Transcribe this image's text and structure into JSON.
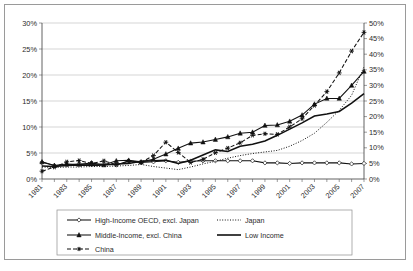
{
  "chart_data": {
    "type": "line",
    "title": "",
    "subtitle": "",
    "xlabel": "",
    "ylabel": "",
    "grid": true,
    "legend_position": "bottom",
    "x": [
      1981,
      1982,
      1983,
      1984,
      1985,
      1986,
      1987,
      1988,
      1989,
      1990,
      1991,
      1992,
      1993,
      1994,
      1995,
      1996,
      1997,
      1998,
      1999,
      2000,
      2001,
      2002,
      2003,
      2004,
      2005,
      2006,
      2007
    ],
    "xtick_labels": [
      "1981",
      "1983",
      "1985",
      "1987",
      "1989",
      "1991",
      "1993",
      "1995",
      "1997",
      "1999",
      "2001",
      "2003",
      "2005",
      "2007"
    ],
    "xlim": [
      1981,
      2007
    ],
    "left_axis": {
      "ylim": [
        0,
        30
      ],
      "ticks": [
        0,
        5,
        10,
        15,
        20,
        25,
        30
      ],
      "tick_labels": [
        "0%",
        "5%",
        "10%",
        "15%",
        "20%",
        "25%",
        "30%"
      ]
    },
    "right_axis": {
      "ylim": [
        0,
        50
      ],
      "ticks": [
        0,
        5,
        10,
        15,
        20,
        25,
        30,
        35,
        40,
        45,
        50
      ],
      "tick_labels": [
        "0%",
        "5%",
        "10%",
        "15%",
        "20%",
        "25%",
        "30%",
        "35%",
        "40%",
        "45%",
        "50%"
      ]
    },
    "series": [
      {
        "name": "High-Income OECD, excl. Japan",
        "axis": "left",
        "style": "solid-with-open-diamond",
        "dash": "none",
        "marker": "open-diamond",
        "values": [
          3.2,
          2.6,
          2.7,
          2.9,
          2.8,
          2.9,
          2.7,
          3.5,
          3.2,
          3.3,
          3.5,
          3.2,
          3.4,
          3.5,
          3.5,
          3.5,
          3.5,
          3.5,
          3.1,
          3.1,
          3.0,
          3.1,
          3.1,
          3.1,
          3.1,
          2.9,
          3.0
        ]
      },
      {
        "name": "Japan",
        "axis": "left",
        "style": "dotted",
        "dash": "1,1.6",
        "marker": "none",
        "values": [
          2.3,
          2.2,
          2.3,
          2.3,
          2.4,
          2.4,
          2.5,
          2.6,
          2.8,
          2.4,
          2.1,
          1.8,
          2.3,
          2.9,
          3.4,
          4.0,
          4.5,
          4.9,
          5.2,
          5.5,
          6.3,
          7.4,
          8.8,
          10.9,
          13.2,
          16.1,
          21.6
        ]
      },
      {
        "name": "Middle-Income, excl. China",
        "axis": "left",
        "style": "solid-with-filled-triangle",
        "dash": "none",
        "marker": "filled-triangle",
        "values": [
          3.3,
          2.6,
          2.9,
          2.8,
          3.1,
          2.7,
          3.5,
          3.6,
          3.3,
          3.8,
          4.8,
          5.9,
          6.9,
          7.1,
          7.6,
          8.1,
          8.8,
          9.0,
          10.3,
          10.4,
          11.1,
          12.3,
          14.4,
          15.5,
          15.5,
          18.0,
          20.7
        ]
      },
      {
        "name": "Low Income",
        "axis": "left",
        "style": "solid-thick",
        "dash": "none",
        "marker": "none",
        "values": [
          2.5,
          2.4,
          2.6,
          2.7,
          2.6,
          2.7,
          2.9,
          3.0,
          3.4,
          3.5,
          3.6,
          3.0,
          3.6,
          4.6,
          5.6,
          5.3,
          6.3,
          6.7,
          7.3,
          8.4,
          9.6,
          10.8,
          12.1,
          12.5,
          13.0,
          14.6,
          16.4
        ]
      },
      {
        "name": "China",
        "axis": "right",
        "style": "dashed-with-star",
        "dash": "4,2",
        "marker": "star",
        "values": [
          2.5,
          3.8,
          5.5,
          5.9,
          5.0,
          5.8,
          4.6,
          5.6,
          5.3,
          7.5,
          11.8,
          8.5,
          5.3,
          6.3,
          8.4,
          9.9,
          11.6,
          14.0,
          14.5,
          14.3,
          16.7,
          19.3,
          23.6,
          28.0,
          34.0,
          41.0,
          47.0
        ]
      }
    ]
  },
  "legend": {
    "items": [
      {
        "label": "High-Income OECD, excl. Japan",
        "marker": "open-diamond"
      },
      {
        "label": "Japan",
        "marker": "none"
      },
      {
        "label": "Middle-Income, excl. China",
        "marker": "filled-triangle"
      },
      {
        "label": "Low Income",
        "marker": "none"
      },
      {
        "label": "China",
        "marker": "star"
      }
    ]
  }
}
